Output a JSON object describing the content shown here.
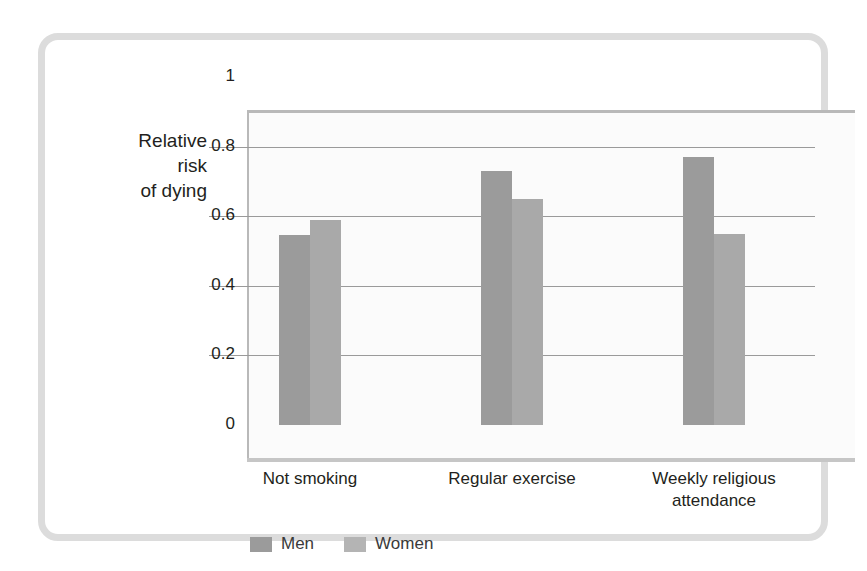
{
  "chart_data": {
    "type": "bar",
    "title": "",
    "xlabel": "",
    "ylabel": "Relative\nrisk\nof dying",
    "categories": [
      "Not smoking",
      "Regular exercise",
      "Weekly religious\nattendance"
    ],
    "series": [
      {
        "name": "Men",
        "color": "#9b9b9b",
        "values": [
          0.545,
          0.73,
          0.77
        ]
      },
      {
        "name": "Women",
        "color": "#a9a9a9",
        "values": [
          0.59,
          0.65,
          0.55
        ]
      }
    ],
    "ylim": [
      0,
      1
    ],
    "yticks": [
      "0",
      "0.2",
      "0.4",
      "0.6",
      "0.8",
      "1"
    ],
    "ytick_values": [
      0,
      0.2,
      0.4,
      0.6,
      0.8,
      1
    ],
    "grid": true,
    "grid_axis": "y",
    "legend_position": "bottom-left",
    "legend": [
      "Men",
      "Women"
    ]
  },
  "frame": {
    "border_color": "#dcdcdc",
    "plot_background": "#fbfbfb",
    "axis_color": "#b9b9b9",
    "gridline_color": "#9a9a9a"
  }
}
